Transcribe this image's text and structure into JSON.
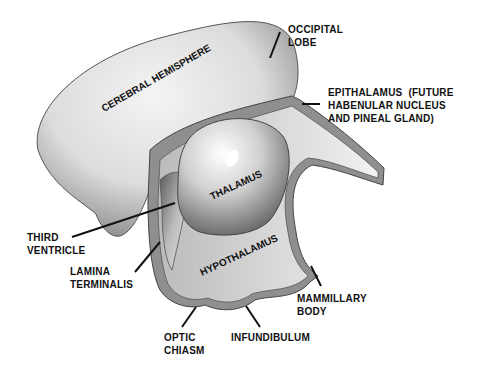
{
  "diagram": {
    "type": "anatomical",
    "inner_labels": {
      "cerebral_hemisphere": "CEREBRAL HEMISPHERE",
      "thalamus": "THALAMUS",
      "hypothalamus": "HYPOTHALAMUS"
    },
    "callouts": [
      {
        "id": "occipital-lobe",
        "text": "OCCIPITAL\nLOBE"
      },
      {
        "id": "epithalamus",
        "text": "EPITHALAMUS  (FUTURE\nHABENULAR NUCLEUS\nAND PINEAL GLAND)"
      },
      {
        "id": "third-ventricle",
        "text": "THIRD\nVENTRICLE"
      },
      {
        "id": "lamina-terminalis",
        "text": "LAMINA\nTERMINALIS"
      },
      {
        "id": "mammillary-body",
        "text": "MAMMILLARY\nBODY"
      },
      {
        "id": "optic-chiasm",
        "text": "OPTIC\nCHIASM"
      },
      {
        "id": "infundibulum",
        "text": "INFUNDIBULUM"
      }
    ],
    "colors": {
      "background": "#ffffff",
      "hemisphere_light": "#e8e8e8",
      "hemisphere_dark": "#6a6a6a",
      "wall": "#8c8c8c",
      "text": "#111111"
    }
  }
}
